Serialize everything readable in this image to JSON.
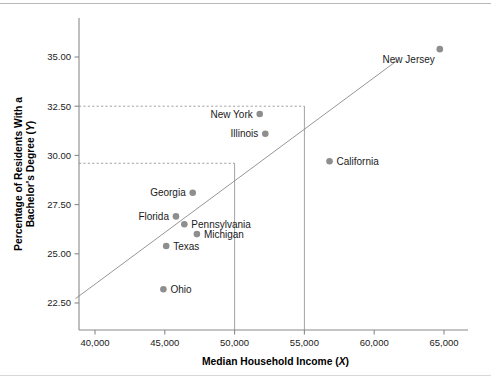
{
  "chart_data": {
    "type": "scatter",
    "title": "",
    "xlabel": "Median Household Income (X)",
    "ylabel": "Percentage of Residents With a Bachelor's Degree (Y)",
    "xlabel_text": "Median Household Income (",
    "xlabel_var": "X",
    "ylabel_line1": "Percentage of Residents With a",
    "ylabel_line2": "Bachelor's Degree (",
    "ylabel_var": "Y",
    "xlim": [
      38600,
      66200
    ],
    "ylim": [
      21800,
      36300
    ],
    "ylim_real": [
      21.8,
      36.3
    ],
    "grid": false,
    "legend": "none",
    "xticks": [
      40000,
      45000,
      50000,
      55000,
      60000,
      65000
    ],
    "xtick_labels": [
      "40,000",
      "45,000",
      "50,000",
      "55,000",
      "60,000",
      "65,000"
    ],
    "yticks": [
      22.5,
      25.0,
      27.5,
      30.0,
      32.5,
      35.0
    ],
    "ytick_labels": [
      "22.50",
      "25.00",
      "27.50",
      "30.00",
      "32.50",
      "35.00"
    ],
    "points": [
      {
        "label": "New Jersey",
        "x": 64700,
        "y": 35.4,
        "label_pos": "below-left"
      },
      {
        "label": "New York",
        "x": 51800,
        "y": 32.1,
        "label_pos": "left"
      },
      {
        "label": "Illinois",
        "x": 52200,
        "y": 31.1,
        "label_pos": "left"
      },
      {
        "label": "California",
        "x": 56800,
        "y": 29.7,
        "label_pos": "right"
      },
      {
        "label": "Georgia",
        "x": 47000,
        "y": 28.1,
        "label_pos": "left"
      },
      {
        "label": "Florida",
        "x": 45800,
        "y": 26.9,
        "label_pos": "left"
      },
      {
        "label": "Pennsylvania",
        "x": 46400,
        "y": 26.5,
        "label_pos": "right"
      },
      {
        "label": "Michigan",
        "x": 47300,
        "y": 26.0,
        "label_pos": "right"
      },
      {
        "label": "Texas",
        "x": 45100,
        "y": 25.4,
        "label_pos": "right"
      },
      {
        "label": "Ohio",
        "x": 44900,
        "y": 23.2,
        "label_pos": "right"
      }
    ],
    "regression_line": {
      "x_start": 38600,
      "y_start": 22.72,
      "x_end": 61700,
      "y_end": 34.85
    },
    "reference_lines": [
      {
        "x": 50000,
        "y": 29.6,
        "style": "dashed-horizontal-and-vertical"
      },
      {
        "x": 55000,
        "y": 32.5,
        "style": "dashed-horizontal-and-vertical"
      }
    ],
    "colors": {
      "point": "#8e8e8e",
      "line": "#8a8a8a",
      "axis": "#8a8a8a",
      "text": "#1a1a1a",
      "background": "#ffffff"
    }
  }
}
